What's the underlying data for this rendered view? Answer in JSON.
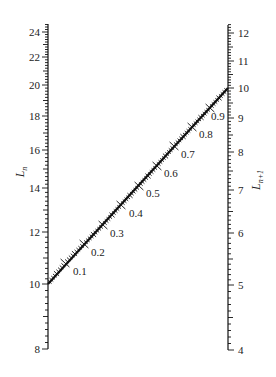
{
  "diagram": {
    "type": "nomogram",
    "left_axis": {
      "label": "L",
      "label_sub": "n",
      "x": 48,
      "tick_labels": [
        {
          "value": "24",
          "y": 32
        },
        {
          "value": "22",
          "y": 57
        },
        {
          "value": "20",
          "y": 85
        },
        {
          "value": "18",
          "y": 116
        },
        {
          "value": "16",
          "y": 150
        },
        {
          "value": "14",
          "y": 188
        },
        {
          "value": "12",
          "y": 232
        },
        {
          "value": "10",
          "y": 284
        },
        {
          "value": "8",
          "y": 349
        }
      ],
      "range": [
        8,
        25
      ]
    },
    "right_axis": {
      "label": "L",
      "label_sub": "n+1",
      "x": 228,
      "tick_labels": [
        {
          "value": "12",
          "y": 33
        },
        {
          "value": "11",
          "y": 61
        },
        {
          "value": "10",
          "y": 88
        },
        {
          "value": "9",
          "y": 118
        },
        {
          "value": "8",
          "y": 152
        },
        {
          "value": "7",
          "y": 190
        },
        {
          "value": "6",
          "y": 233
        },
        {
          "value": "5",
          "y": 285
        },
        {
          "value": "4",
          "y": 350
        }
      ],
      "range": [
        4,
        12.5
      ]
    },
    "diagonal_scale": {
      "start": [
        48,
        284
      ],
      "end": [
        228,
        88
      ],
      "tick_labels": [
        {
          "value": "0.1",
          "tick": [
            65,
            263
          ],
          "label": [
            73,
            275
          ]
        },
        {
          "value": "0.2",
          "tick": [
            84,
            244
          ],
          "label": [
            91,
            256
          ]
        },
        {
          "value": "0.3",
          "tick": [
            103,
            225
          ],
          "label": [
            110,
            237
          ]
        },
        {
          "value": "0.4",
          "tick": [
            121,
            205
          ],
          "label": [
            129,
            217
          ]
        },
        {
          "value": "0.5",
          "tick": [
            139,
            186
          ],
          "label": [
            146,
            197
          ]
        },
        {
          "value": "0.6",
          "tick": [
            157,
            166
          ],
          "label": [
            164,
            177
          ]
        },
        {
          "value": "0.7",
          "tick": [
            174,
            146
          ],
          "label": [
            181,
            158
          ]
        },
        {
          "value": "0.8",
          "tick": [
            192,
            127
          ],
          "label": [
            199,
            138
          ]
        },
        {
          "value": "0.9",
          "tick": [
            210,
            108
          ],
          "label": [
            211,
            120
          ]
        }
      ]
    }
  }
}
